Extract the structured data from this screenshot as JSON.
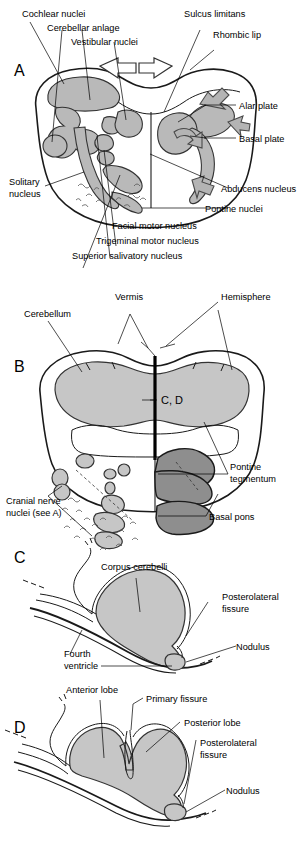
{
  "figure": {
    "panels": [
      {
        "id": "A",
        "letter": "A",
        "caption": "Transverse section of the developing pons showing cranial nerve nuclei, alar and basal plates",
        "labels": [
          {
            "name": "cochlear-nuclei",
            "text": "Cochlear nuclei"
          },
          {
            "name": "cerebellar-anlage",
            "text": "Cerebellar anlage"
          },
          {
            "name": "vestibular-nuclei",
            "text": "Vestibular nuclei"
          },
          {
            "name": "sulcus-limitans",
            "text": "Sulcus limitans"
          },
          {
            "name": "rhombic-lip",
            "text": "Rhombic lip"
          },
          {
            "name": "alar-plate",
            "text": "Alar plate"
          },
          {
            "name": "basal-plate",
            "text": "Basal plate"
          },
          {
            "name": "abducens-nucleus",
            "text": "Abducens nucleus"
          },
          {
            "name": "pontine-nuclei",
            "text": "Pontine nuclei"
          },
          {
            "name": "solitary-nucleus-line1",
            "text": "Solitary"
          },
          {
            "name": "solitary-nucleus-line2",
            "text": "nucleus"
          },
          {
            "name": "facial-motor-nucleus",
            "text": "Facial motor nucleus"
          },
          {
            "name": "trigeminal-motor-nucleus",
            "text": "Trigeminal motor nucleus"
          },
          {
            "name": "superior-salivatory-nucleus",
            "text": "Superior salivatory nucleus"
          }
        ]
      },
      {
        "id": "B",
        "letter": "B",
        "caption": "Transverse section of the mature pons and cerebellum",
        "labels": [
          {
            "name": "cerebellum",
            "text": "Cerebellum"
          },
          {
            "name": "vermis",
            "text": "Vermis"
          },
          {
            "name": "hemisphere",
            "text": "Hemisphere"
          },
          {
            "name": "plane-c-d",
            "text": "C, D"
          },
          {
            "name": "pontine-tegmentum-line1",
            "text": "Pontine"
          },
          {
            "name": "pontine-tegmentum-line2",
            "text": "tegmentum"
          },
          {
            "name": "basal-pons",
            "text": "Basal pons"
          },
          {
            "name": "cranial-nerve-nuclei-line1",
            "text": "Cranial nerve"
          },
          {
            "name": "cranial-nerve-nuclei-line2",
            "text": "nuclei (see A)"
          }
        ]
      },
      {
        "id": "C",
        "letter": "C",
        "caption": "Midsagittal section of the embryonic cerebellum",
        "labels": [
          {
            "name": "corpus-cerebelli",
            "text": "Corpus cerebelli"
          },
          {
            "name": "posterolateral-fissure-line1",
            "text": "Posterolateral"
          },
          {
            "name": "posterolateral-fissure-line2",
            "text": "fissure"
          },
          {
            "name": "nodulus",
            "text": "Nodulus"
          },
          {
            "name": "fourth-ventricle-line1",
            "text": "Fourth"
          },
          {
            "name": "fourth-ventricle-line2",
            "text": "ventricle"
          }
        ]
      },
      {
        "id": "D",
        "letter": "D",
        "caption": "Midsagittal section of the mature cerebellum showing lobes and fissures",
        "labels": [
          {
            "name": "anterior-lobe",
            "text": "Anterior lobe"
          },
          {
            "name": "primary-fissure",
            "text": "Primary fissure"
          },
          {
            "name": "posterior-lobe",
            "text": "Posterior lobe"
          },
          {
            "name": "posterolateral-fissure-line1",
            "text": "Posterolateral"
          },
          {
            "name": "posterolateral-fissure-line2",
            "text": "fissure"
          },
          {
            "name": "nodulus",
            "text": "Nodulus"
          }
        ]
      }
    ],
    "colors": {
      "background": "#ffffff",
      "ink": "#000000",
      "gray_light": "#c6c6c6",
      "gray_mid": "#b9b9b9",
      "gray_dark": "#8e8e8e",
      "outline": "#1a1a1a"
    }
  }
}
